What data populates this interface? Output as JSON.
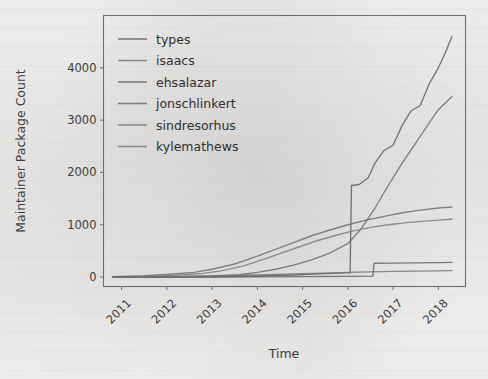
{
  "figure": {
    "background_color": "#f2f1ef",
    "frame_color": "#6e6e6e",
    "text_color": "#3b3b3b"
  },
  "chart_data": {
    "type": "line",
    "title": "",
    "xlabel": "Time",
    "ylabel": "Maintainer Package Count",
    "xlim": [
      2010.6,
      2018.6
    ],
    "ylim": [
      -180,
      5000
    ],
    "xticks": [
      2011,
      2012,
      2013,
      2014,
      2015,
      2016,
      2017,
      2018
    ],
    "xtick_labels": [
      "2011",
      "2012",
      "2013",
      "2014",
      "2015",
      "2016",
      "2017",
      "2018"
    ],
    "xtick_rotation": 45,
    "yticks": [
      0,
      1000,
      2000,
      3000,
      4000
    ],
    "ytick_labels": [
      "0",
      "1000",
      "2000",
      "3000",
      "4000"
    ],
    "grid": false,
    "legend_position": "upper left",
    "legend_frame": false,
    "series": [
      {
        "name": "types",
        "color": "#5a5a5a",
        "x": [
          2010.8,
          2012.0,
          2013.0,
          2014.0,
          2014.8,
          2015.4,
          2015.8,
          2015.95,
          2016.05,
          2016.08,
          2016.25,
          2016.45,
          2016.6,
          2016.8,
          2017.0,
          2017.2,
          2017.4,
          2017.6,
          2017.8,
          2018.0,
          2018.15,
          2018.3
        ],
        "y": [
          0,
          0,
          5,
          20,
          40,
          60,
          75,
          80,
          80,
          1750,
          1770,
          1900,
          2180,
          2420,
          2520,
          2900,
          3180,
          3280,
          3700,
          4000,
          4280,
          4600
        ]
      },
      {
        "name": "isaacs",
        "color": "#6d6d6d",
        "x": [
          2010.8,
          2011.5,
          2012.0,
          2012.6,
          2013.0,
          2013.5,
          2014.0,
          2014.4,
          2014.8,
          2015.2,
          2015.6,
          2016.0,
          2016.4,
          2016.8,
          2017.2,
          2017.6,
          2018.0,
          2018.3
        ],
        "y": [
          10,
          25,
          50,
          90,
          150,
          250,
          400,
          530,
          660,
          790,
          900,
          1000,
          1090,
          1160,
          1230,
          1280,
          1320,
          1340
        ]
      },
      {
        "name": "ehsalazar",
        "color": "#606060",
        "x": [
          2010.8,
          2012.0,
          2013.0,
          2014.0,
          2015.0,
          2016.0,
          2016.55,
          2016.58,
          2017.0,
          2017.5,
          2018.0,
          2018.3
        ],
        "y": [
          0,
          0,
          2,
          5,
          10,
          15,
          18,
          265,
          268,
          272,
          276,
          280
        ]
      },
      {
        "name": "jonschlinkert",
        "color": "#666666",
        "x": [
          2010.8,
          2012.0,
          2013.0,
          2013.6,
          2014.0,
          2014.4,
          2014.8,
          2015.2,
          2015.6,
          2016.0,
          2016.3,
          2016.6,
          2016.9,
          2017.2,
          2017.5,
          2017.8,
          2018.0,
          2018.3
        ],
        "y": [
          0,
          5,
          20,
          45,
          90,
          150,
          230,
          330,
          460,
          640,
          930,
          1320,
          1760,
          2180,
          2560,
          2950,
          3200,
          3450
        ]
      },
      {
        "name": "sindresorhus",
        "color": "#7a7a7a",
        "x": [
          2010.8,
          2011.6,
          2012.2,
          2012.8,
          2013.2,
          2013.7,
          2014.1,
          2014.5,
          2014.9,
          2015.3,
          2015.7,
          2016.1,
          2016.5,
          2016.9,
          2017.3,
          2017.7,
          2018.0,
          2018.3
        ],
        "y": [
          5,
          15,
          35,
          70,
          120,
          215,
          330,
          450,
          570,
          690,
          790,
          880,
          950,
          1000,
          1040,
          1070,
          1090,
          1105
        ]
      },
      {
        "name": "kylemathews",
        "color": "#737373",
        "x": [
          2010.8,
          2012.0,
          2013.0,
          2014.0,
          2014.8,
          2015.4,
          2016.0,
          2016.5,
          2017.0,
          2017.5,
          2018.0,
          2018.3
        ],
        "y": [
          0,
          8,
          20,
          40,
          60,
          75,
          90,
          100,
          108,
          114,
          118,
          122
        ]
      }
    ]
  }
}
